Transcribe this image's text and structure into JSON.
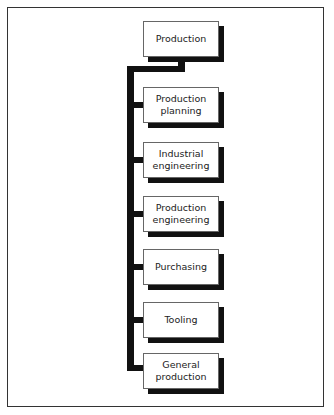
{
  "diagram": {
    "title_box": "Production",
    "children": [
      "Production\nplanning",
      "Industrial\nengineering",
      "Production\nengineering",
      "Purchasing",
      "Tooling",
      "General\nproduction"
    ]
  },
  "colors": {
    "connector": "#111111",
    "shadow": "#111111",
    "frame": "#333333",
    "box_fill": "#ffffff"
  }
}
